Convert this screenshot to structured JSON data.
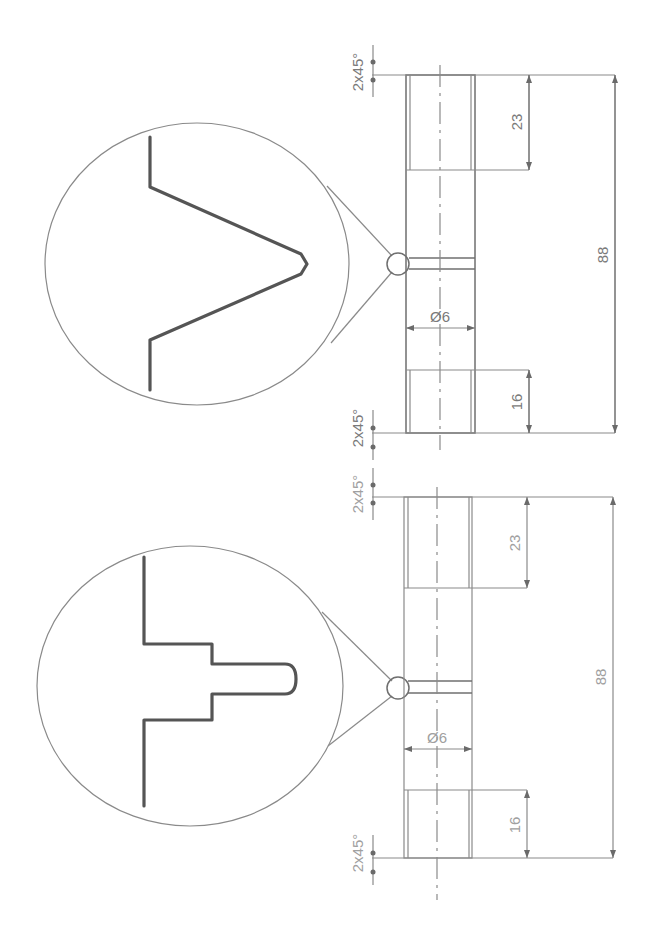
{
  "drawing": {
    "type": "engineering-drawing",
    "orientation": "rotated-90",
    "views": [
      {
        "id": "v-thread-detail",
        "detail_profile": "v-notch",
        "dimensions": {
          "chamfer_top": "2x45°",
          "chamfer_bottom": "2x45°",
          "length_top_section": "23",
          "length_bottom_section": "16",
          "overall_length": "88",
          "diameter": "Ø6"
        }
      },
      {
        "id": "stepped-groove-detail",
        "detail_profile": "stepped-groove",
        "dimensions": {
          "chamfer_top": "2x45°",
          "chamfer_bottom": "2x45°",
          "length_top_section": "23",
          "length_bottom_section": "16",
          "overall_length": "88",
          "diameter": "Ø6"
        }
      }
    ],
    "colors": {
      "line": "#6f6f6f",
      "profile": "#555555",
      "text": "#7a7a7a",
      "background": "#ffffff"
    }
  }
}
